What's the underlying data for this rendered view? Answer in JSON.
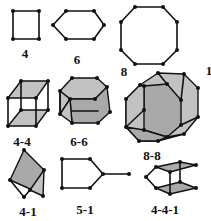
{
  "colors": {
    "line": "#111111",
    "face": "#a9a9a9",
    "face_light": "#c2c2c2",
    "background": "#ffffff"
  },
  "structures": [
    {
      "id": "s4",
      "label": "4",
      "label_pos": [
        25,
        47
      ]
    },
    {
      "id": "s6",
      "label": "6",
      "label_pos": [
        77,
        53
      ]
    },
    {
      "id": "s8",
      "label": "8",
      "label_pos": [
        124,
        65
      ]
    },
    {
      "id": "s_cut",
      "label": "1",
      "label_pos": [
        209,
        64
      ]
    },
    {
      "id": "s44",
      "label": "4-4",
      "label_pos": [
        22,
        135
      ]
    },
    {
      "id": "s66",
      "label": "6-6",
      "label_pos": [
        79,
        135
      ]
    },
    {
      "id": "s88",
      "label": "8-8",
      "label_pos": [
        152,
        152
      ]
    },
    {
      "id": "s41",
      "label": "4-1",
      "label_pos": [
        28,
        205
      ]
    },
    {
      "id": "s51",
      "label": "5-1",
      "label_pos": [
        85,
        203
      ]
    },
    {
      "id": "s441",
      "label": "4-4-1",
      "label_pos": [
        165,
        203
      ]
    }
  ]
}
